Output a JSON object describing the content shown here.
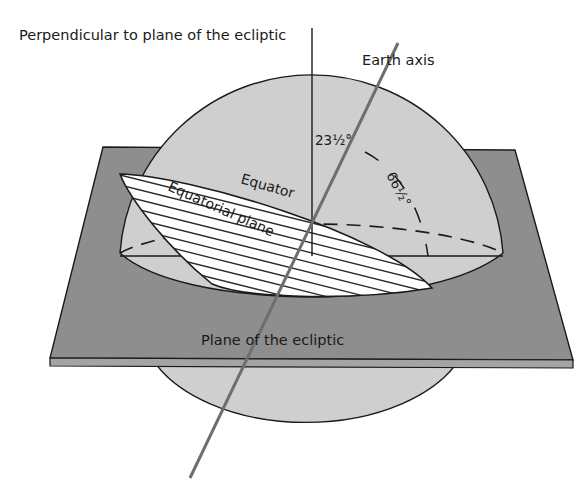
{
  "diagram": {
    "labels": {
      "perpendicular": "Perpendicular to plane of the ecliptic",
      "earth_axis": "Earth axis",
      "equator": "Equator",
      "equatorial_plane": "Equatorial plane",
      "plane_of_ecliptic": "Plane of the ecliptic",
      "angle_small": "23½°",
      "angle_large": "66½°"
    },
    "colors": {
      "background": "#ffffff",
      "sphere": "#cfcfcf",
      "plane": "#8e8e8e",
      "plane_edge": "#a4a4a4",
      "equatorial_plane": "#ffffff",
      "hatch": "#2a2a2a",
      "axis": "#6e6e6e",
      "outline": "#1a1a1a"
    },
    "angles_deg": {
      "axial_tilt": 23.5,
      "axis_to_ecliptic": 66.5
    }
  }
}
